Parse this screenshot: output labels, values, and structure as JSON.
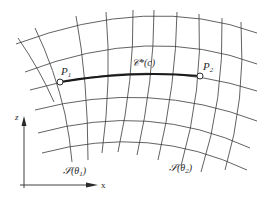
{
  "diagram": {
    "type": "curvilinear-grid",
    "labels": {
      "point_1": "P",
      "point_1_sub": "1",
      "point_2": "P",
      "point_2_sub": "2",
      "curve": "𝒞*(c)",
      "surface_1": "𝒮(θ",
      "surface_1_sub": "1",
      "surface_1_close": ")",
      "surface_2": "𝒮(θ",
      "surface_2_sub": "2",
      "surface_2_close": ")",
      "axis_z": "z",
      "axis_x": "x"
    },
    "points": [
      {
        "name": "P1",
        "x": 60,
        "y": 82
      },
      {
        "name": "P2",
        "x": 200,
        "y": 76
      }
    ],
    "colors": {
      "line": "#3a3a3a",
      "highlight_curve": "#1a1a1a",
      "background": "#ffffff"
    }
  }
}
